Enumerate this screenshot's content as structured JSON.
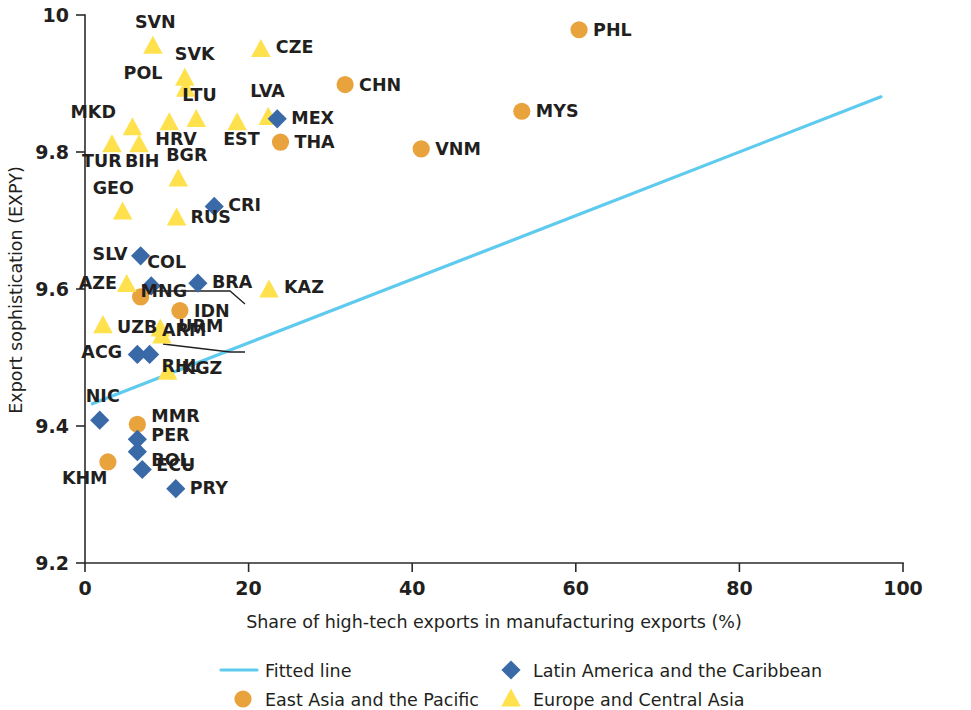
{
  "chart_data": {
    "type": "scatter",
    "title": "",
    "xlabel": "Share of high-tech exports in manufacturing exports (%)",
    "ylabel": "Export sophistication (EXPY)",
    "xlim": [
      0,
      100
    ],
    "ylim": [
      9.2,
      10.0
    ],
    "xticks": [
      0,
      20,
      40,
      60,
      80,
      100
    ],
    "yticks": [
      9.2,
      9.4,
      9.6,
      9.8,
      10
    ],
    "xtick_labels": [
      "0",
      "20",
      "40",
      "60",
      "80",
      "100"
    ],
    "ytick_labels": [
      "9.2",
      "9.4",
      "9.6",
      "9.8",
      "10"
    ],
    "grid": false,
    "legend_position": "below-axis",
    "colors": {
      "east_asia_pacific": "#e8a33d",
      "europe_central_asia": "#ffe14d",
      "latin_america_caribbean": "#3a69a8",
      "fitted_line": "#5ecbee",
      "axis": "#2b2b2b",
      "text": "#231f20"
    },
    "series": [
      {
        "name": "Fitted line",
        "key": "fitted_line",
        "marker": "line",
        "x": [
          0.9,
          97.3
        ],
        "y": [
          9.4325,
          9.8805
        ]
      },
      {
        "name": "East Asia and the Pacific",
        "key": "east_asia_pacific",
        "marker": "circle",
        "points": [
          {
            "code": "PHL",
            "x": 60.4,
            "y": 9.9785,
            "label_dx": 14,
            "label_dy": 6
          },
          {
            "code": "CHN",
            "x": 31.8,
            "y": 9.8985,
            "label_dx": 14,
            "label_dy": 6
          },
          {
            "code": "MYS",
            "x": 53.4,
            "y": 9.8595,
            "label_dx": 14,
            "label_dy": 6
          },
          {
            "code": "VNM",
            "x": 41.1,
            "y": 9.8045,
            "label_dx": 14,
            "label_dy": 6
          },
          {
            "code": "THA",
            "x": 23.9,
            "y": 9.8145,
            "label_dx": 14,
            "label_dy": 6
          },
          {
            "code": "IDN",
            "x": 11.6,
            "y": 9.5685,
            "label_dx": 14,
            "label_dy": 6
          },
          {
            "code": "MNG",
            "x": 6.8,
            "y": 9.5885,
            "label_dx": 0,
            "label_dy": 0
          },
          {
            "code": "MMR",
            "x": 6.4,
            "y": 9.4025,
            "label_dx": 14,
            "label_dy": -2
          },
          {
            "code": "KHM",
            "x": 2.8,
            "y": 9.3475,
            "label_dx": -46,
            "label_dy": 22
          }
        ]
      },
      {
        "name": "Europe and Central Asia",
        "key": "europe_central_asia",
        "marker": "triangle",
        "points": [
          {
            "code": "SVN",
            "x": 8.3,
            "y": 9.9545,
            "label_dx": -18,
            "label_dy": -18
          },
          {
            "code": "CZE",
            "x": 21.5,
            "y": 9.9495,
            "label_dx": 15,
            "label_dy": 3
          },
          {
            "code": "SVK",
            "x": 12.2,
            "y": 9.9075,
            "label_dx": -10,
            "label_dy": -18
          },
          {
            "code": "POL",
            "x": 12.3,
            "y": 9.8915,
            "label_dx": -62,
            "label_dy": -10
          },
          {
            "code": "LTU",
            "x": 13.6,
            "y": 9.8475,
            "label_dx": -14,
            "label_dy": -18
          },
          {
            "code": "LVA",
            "x": 22.4,
            "y": 9.8505,
            "label_dx": -18,
            "label_dy": -20
          },
          {
            "code": "MKD",
            "x": 5.8,
            "y": 9.8355,
            "label_dx": -62,
            "label_dy": -10
          },
          {
            "code": "HRV",
            "x": 10.3,
            "y": 9.8425,
            "label_dx": -14,
            "label_dy": 22
          },
          {
            "code": "EST",
            "x": 18.6,
            "y": 9.8425,
            "label_dx": -14,
            "label_dy": 22
          },
          {
            "code": "TUR",
            "x": 3.3,
            "y": 9.8105,
            "label_dx": -30,
            "label_dy": 22
          },
          {
            "code": "BIH",
            "x": 6.6,
            "y": 9.8105,
            "label_dx": -14,
            "label_dy": 22
          },
          {
            "code": "BGR",
            "x": 11.4,
            "y": 9.7605,
            "label_dx": -12,
            "label_dy": -18
          },
          {
            "code": "GEO",
            "x": 4.6,
            "y": 9.7125,
            "label_dx": -30,
            "label_dy": -18
          },
          {
            "code": "RUS",
            "x": 11.2,
            "y": 9.7035,
            "label_dx": 14,
            "label_dy": 5
          },
          {
            "code": "AZE",
            "x": 5.1,
            "y": 9.6065,
            "label_dx": -48,
            "label_dy": 4
          },
          {
            "code": "KAZ",
            "x": 22.5,
            "y": 9.5985,
            "label_dx": 15,
            "label_dy": 3
          },
          {
            "code": "UZB",
            "x": 2.2,
            "y": 9.5465,
            "label_dx": 14,
            "label_dy": 7
          },
          {
            "code": "ARM",
            "x": 9.4,
            "y": 9.5315,
            "label_dx": 0,
            "label_dy": 0
          },
          {
            "code": "URM",
            "x": 9.2,
            "y": 9.5415,
            "label_dx": 18,
            "label_dy": 3
          },
          {
            "code": "KGZ",
            "x": 10.1,
            "y": 9.4785,
            "label_dx": 14,
            "label_dy": 2
          }
        ]
      },
      {
        "name": "Latin America and the Caribbean",
        "key": "latin_america_caribbean",
        "marker": "diamond",
        "points": [
          {
            "code": "MEX",
            "x": 23.5,
            "y": 9.8485,
            "label_dx": 14,
            "label_dy": 5
          },
          {
            "code": "CRI",
            "x": 15.8,
            "y": 9.7205,
            "label_dx": 14,
            "label_dy": 5
          },
          {
            "code": "SLV",
            "x": 6.8,
            "y": 9.6485,
            "label_dx": -48,
            "label_dy": 4
          },
          {
            "code": "COL",
            "x": 8.1,
            "y": 9.6045,
            "label_dx": -4,
            "label_dy": -18
          },
          {
            "code": "BRA",
            "x": 13.8,
            "y": 9.6085,
            "label_dx": 14,
            "label_dy": 5
          },
          {
            "code": "ACG",
            "x": 6.4,
            "y": 9.5045,
            "label_dx": -56,
            "label_dy": 4
          },
          {
            "code": "RHL",
            "x": 7.9,
            "y": 9.5045,
            "label_dx": 12,
            "label_dy": 18
          },
          {
            "code": "NIC",
            "x": 1.8,
            "y": 9.4085,
            "label_dx": -14,
            "label_dy": -18
          },
          {
            "code": "PER",
            "x": 6.4,
            "y": 9.3805,
            "label_dx": 14,
            "label_dy": 2
          },
          {
            "code": "BOL",
            "x": 6.4,
            "y": 9.3625,
            "label_dx": 14,
            "label_dy": 14
          },
          {
            "code": "ECU",
            "x": 7.0,
            "y": 9.3365,
            "label_dx": 14,
            "label_dy": 2
          },
          {
            "code": "PRY",
            "x": 11.1,
            "y": 9.3085,
            "label_dx": 14,
            "label_dy": 5
          }
        ]
      }
    ],
    "leader_lines": [
      {
        "from": "MNG-marker",
        "points": "150,291 230,291 245,304"
      },
      {
        "from": "ARM-marker",
        "points": "163,344 230,352 245,352"
      }
    ]
  },
  "legend": {
    "items": [
      {
        "marker": "line",
        "label": "Fitted line",
        "key": "fitted_line"
      },
      {
        "marker": "diamond",
        "label": "Latin America and the Caribbean",
        "key": "latin_america_caribbean"
      },
      {
        "marker": "circle",
        "label": "East Asia and the Pacific",
        "key": "east_asia_pacific"
      },
      {
        "marker": "triangle",
        "label": "Europe and Central Asia",
        "key": "europe_central_asia"
      }
    ]
  }
}
